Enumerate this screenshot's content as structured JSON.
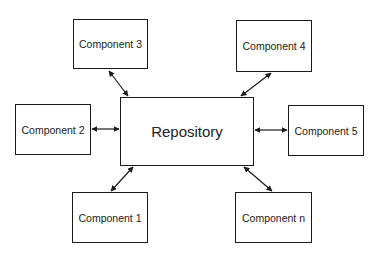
{
  "diagram": {
    "center": {
      "id": "repo",
      "label": "Repository",
      "box": [
        120,
        97,
        134,
        69
      ]
    },
    "nodes": [
      {
        "id": "c3",
        "label": "Component 3",
        "box": [
          73,
          19,
          75,
          50
        ]
      },
      {
        "id": "c4",
        "label": "Component 4",
        "box": [
          236,
          20,
          76,
          52
        ]
      },
      {
        "id": "c2",
        "label": "Component 2",
        "box": [
          15,
          104,
          76,
          51
        ]
      },
      {
        "id": "c5",
        "label": "Component 5",
        "box": [
          288,
          105,
          76,
          51
        ]
      },
      {
        "id": "c1",
        "label": "Component 1",
        "box": [
          72,
          192,
          76,
          51
        ]
      },
      {
        "id": "cn",
        "label": "Component n",
        "box": [
          235,
          192,
          77,
          51
        ]
      }
    ],
    "edges": [
      {
        "from": "c3",
        "to": "repo",
        "type": "bidirectional"
      },
      {
        "from": "c4",
        "to": "repo",
        "type": "bidirectional"
      },
      {
        "from": "c2",
        "to": "repo",
        "type": "bidirectional"
      },
      {
        "from": "c5",
        "to": "repo",
        "type": "bidirectional"
      },
      {
        "from": "c1",
        "to": "repo",
        "type": "bidirectional"
      },
      {
        "from": "cn",
        "to": "repo",
        "type": "bidirectional"
      }
    ],
    "colors": {
      "stroke": "#1a1a1a",
      "fill": "#ffffff",
      "text": "#222222"
    }
  }
}
